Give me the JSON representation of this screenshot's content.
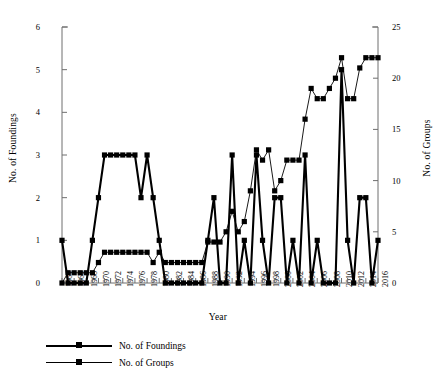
{
  "chart_data": {
    "type": "line",
    "title": "",
    "xlabel": "Year",
    "ylabel": "No. of Foundings",
    "y2label": "No. of Groups",
    "grid": false,
    "legend_position": "bottom-left",
    "xlim": [
      1964,
      2016
    ],
    "ylim": [
      0,
      6
    ],
    "y2lim": [
      0,
      25
    ],
    "ytick_labels": [
      "0",
      "1",
      "2",
      "3",
      "4",
      "5",
      "6"
    ],
    "ytick_values": [
      0,
      1,
      2,
      3,
      4,
      5,
      6
    ],
    "y2tick_labels": [
      "0",
      "5",
      "10",
      "15",
      "20",
      "25"
    ],
    "y2tick_values": [
      0,
      5,
      10,
      15,
      20,
      25
    ],
    "x": [
      1964,
      1965,
      1966,
      1967,
      1968,
      1969,
      1970,
      1971,
      1972,
      1973,
      1974,
      1975,
      1976,
      1977,
      1978,
      1979,
      1980,
      1981,
      1982,
      1983,
      1984,
      1985,
      1986,
      1987,
      1988,
      1989,
      1990,
      1991,
      1992,
      1993,
      1994,
      1995,
      1996,
      1997,
      1998,
      1999,
      2000,
      2001,
      2002,
      2003,
      2004,
      2005,
      2006,
      2007,
      2008,
      2009,
      2010,
      2011,
      2012,
      2013,
      2014,
      2015,
      2016
    ],
    "xtick_labels": [
      "1964",
      "1966",
      "1968",
      "1970",
      "1972",
      "1974",
      "1976",
      "1978",
      "1980",
      "1982",
      "1984",
      "1986",
      "1988",
      "1990",
      "1992",
      "1994",
      "1996",
      "1998",
      "2000",
      "2002",
      "2004",
      "2006",
      "2008",
      "2010",
      "2012",
      "2014",
      "2016"
    ],
    "xtick_values": [
      1964,
      1966,
      1968,
      1970,
      1972,
      1974,
      1976,
      1978,
      1980,
      1982,
      1984,
      1986,
      1988,
      1990,
      1992,
      1994,
      1996,
      1998,
      2000,
      2002,
      2004,
      2006,
      2008,
      2010,
      2012,
      2014,
      2016
    ],
    "series": [
      {
        "name": "No. of Foundings",
        "axis": "left",
        "style": "thick",
        "values": [
          1,
          0,
          0,
          0,
          0,
          1,
          2,
          3,
          3,
          3,
          3,
          3,
          3,
          2,
          3,
          2,
          1,
          0,
          0,
          0,
          0,
          0,
          0,
          0,
          1,
          2,
          0,
          0,
          3,
          0,
          1,
          0,
          3,
          1,
          0,
          2,
          2,
          0,
          1,
          0,
          3,
          0,
          1,
          0,
          0,
          0,
          5,
          1,
          0,
          2,
          2,
          0,
          1
        ]
      },
      {
        "name": "No. of Groups",
        "axis": "right",
        "style": "thin",
        "values": [
          0,
          1,
          1,
          1,
          1,
          1,
          2,
          3,
          3,
          3,
          3,
          3,
          3,
          3,
          3,
          2,
          3,
          2,
          2,
          2,
          2,
          2,
          2,
          2,
          4,
          4,
          4,
          5,
          7,
          5,
          6,
          9,
          13,
          12,
          13,
          9,
          10,
          12,
          12,
          12,
          16,
          19,
          18,
          18,
          19,
          20,
          22,
          18,
          18,
          21,
          22,
          22,
          22
        ]
      }
    ]
  },
  "legend": {
    "items": [
      {
        "label": "No. of Foundings"
      },
      {
        "label": "No. of Groups"
      }
    ]
  }
}
